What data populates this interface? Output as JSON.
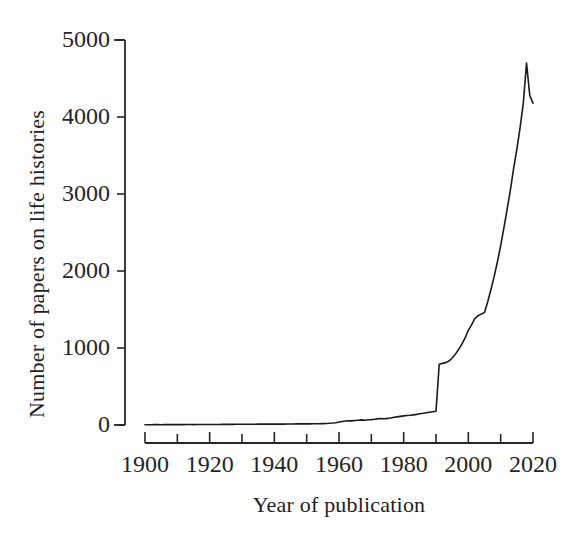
{
  "chart_data": {
    "type": "line",
    "title": "",
    "xlabel": "Year of publication",
    "ylabel": "Number of papers on life histories",
    "xlim": [
      1900,
      2020
    ],
    "ylim": [
      0,
      5000
    ],
    "grid": false,
    "legend": null,
    "x_ticks_major": [
      1900,
      1920,
      1940,
      1960,
      1980,
      2000,
      2020
    ],
    "x_ticks_minor": [
      1910,
      1930,
      1950,
      1970,
      1990,
      2010
    ],
    "x_tick_labels": [
      "1900",
      "1920",
      "1940",
      "1960",
      "1980",
      "2000",
      "2020"
    ],
    "y_ticks": [
      0,
      1000,
      2000,
      3000,
      4000,
      5000
    ],
    "y_tick_labels": [
      "0",
      "1000",
      "2000",
      "3000",
      "4000",
      "5000"
    ],
    "line_color": "#1a1a1a",
    "line_width": 1.6,
    "series": [
      {
        "name": "Papers on life histories",
        "x": [
          1900,
          1901,
          1902,
          1903,
          1904,
          1905,
          1906,
          1907,
          1908,
          1909,
          1910,
          1911,
          1912,
          1913,
          1914,
          1915,
          1916,
          1917,
          1918,
          1919,
          1920,
          1921,
          1922,
          1923,
          1924,
          1925,
          1926,
          1927,
          1928,
          1929,
          1930,
          1931,
          1932,
          1933,
          1934,
          1935,
          1936,
          1937,
          1938,
          1939,
          1940,
          1941,
          1942,
          1943,
          1944,
          1945,
          1946,
          1947,
          1948,
          1949,
          1950,
          1951,
          1952,
          1953,
          1954,
          1955,
          1956,
          1957,
          1958,
          1959,
          1960,
          1961,
          1962,
          1963,
          1964,
          1965,
          1966,
          1967,
          1968,
          1969,
          1970,
          1971,
          1972,
          1973,
          1974,
          1975,
          1976,
          1977,
          1978,
          1979,
          1980,
          1981,
          1982,
          1983,
          1984,
          1985,
          1986,
          1987,
          1988,
          1989,
          1990,
          1991,
          1992,
          1993,
          1994,
          1995,
          1996,
          1997,
          1998,
          1999,
          2000,
          2001,
          2002,
          2003,
          2004,
          2005,
          2006,
          2007,
          2008,
          2009,
          2010,
          2011,
          2012,
          2013,
          2014,
          2015,
          2016,
          2017,
          2018,
          2019,
          2020
        ],
        "y": [
          4,
          4,
          4,
          5,
          5,
          4,
          5,
          5,
          5,
          5,
          5,
          6,
          5,
          6,
          6,
          5,
          6,
          6,
          6,
          6,
          7,
          7,
          7,
          7,
          8,
          8,
          8,
          8,
          9,
          9,
          9,
          9,
          10,
          10,
          10,
          11,
          11,
          11,
          12,
          12,
          12,
          12,
          12,
          12,
          13,
          13,
          13,
          14,
          14,
          14,
          15,
          15,
          16,
          16,
          17,
          18,
          20,
          22,
          25,
          30,
          38,
          46,
          52,
          56,
          54,
          58,
          62,
          66,
          62,
          68,
          70,
          74,
          80,
          84,
          82,
          86,
          92,
          100,
          106,
          112,
          118,
          124,
          126,
          132,
          138,
          146,
          152,
          160,
          166,
          172,
          178,
          790,
          800,
          810,
          830,
          870,
          920,
          980,
          1050,
          1130,
          1230,
          1300,
          1380,
          1420,
          1440,
          1460,
          1600,
          1760,
          1930,
          2120,
          2330,
          2560,
          2800,
          3050,
          3330,
          3580,
          3860,
          4180,
          4700,
          4280,
          4180
        ]
      }
    ],
    "annotations": [
      {
        "text": "sharp discontinuity at 1991",
        "x": 1991,
        "y": 790,
        "visible": false
      }
    ]
  },
  "axes_geometry": {
    "plot_left_px": 145,
    "plot_right_px": 533,
    "y_top_px": 40,
    "y_zero_px": 425,
    "x_axis_line_px": 443
  }
}
